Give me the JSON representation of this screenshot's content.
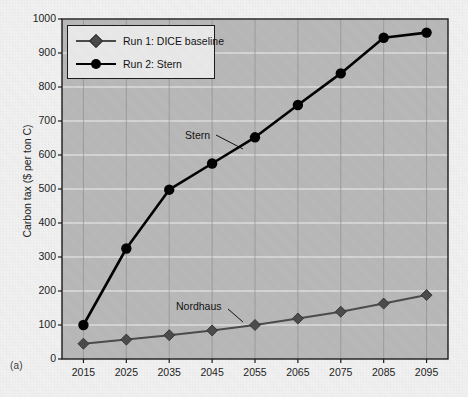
{
  "panel": {
    "label": "(a)"
  },
  "chart_data": {
    "type": "line",
    "title": "",
    "xlabel": "",
    "ylabel": "Carbon tax ($ per ton C)",
    "x": [
      2015,
      2025,
      2035,
      2045,
      2055,
      2065,
      2075,
      2085,
      2095
    ],
    "xtick_labels": [
      "2015",
      "2025",
      "2035",
      "2045",
      "2055",
      "2065",
      "2075",
      "2085",
      "2095"
    ],
    "ytick_labels": [
      "0",
      "100",
      "200",
      "300",
      "400",
      "500",
      "600",
      "700",
      "800",
      "900",
      "1000"
    ],
    "yticks": [
      0,
      100,
      200,
      300,
      400,
      500,
      600,
      700,
      800,
      900,
      1000
    ],
    "ylim": [
      0,
      1000
    ],
    "xlim": [
      2010,
      2100
    ],
    "grid": true,
    "legend_position": "upper-left",
    "series": [
      {
        "name": "Run 1: DICE baseline",
        "marker": "diamond",
        "color": "#4a4a4a",
        "annotation": "Nordhaus",
        "values": [
          45,
          57,
          70,
          84,
          100,
          119,
          139,
          163,
          188
        ]
      },
      {
        "name": "Run 2: Stern",
        "marker": "circle",
        "color": "#000000",
        "annotation": "Stern",
        "values": [
          100,
          325,
          498,
          575,
          652,
          747,
          840,
          945,
          960
        ]
      }
    ]
  },
  "colors": {
    "plot_background": "#b8b8b8",
    "gridline": "#f0f0f0",
    "axis": "#1a1a1a",
    "figure_background": "#f2f2f2"
  }
}
